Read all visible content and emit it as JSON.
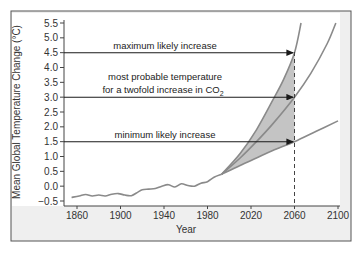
{
  "chart_data": {
    "type": "line",
    "title": "",
    "xlabel": "Year",
    "ylabel": "Mean Global Temperature Change (°C)",
    "xlim": [
      1850,
      2105
    ],
    "ylim": [
      -0.5,
      5.5
    ],
    "x_ticks": [
      "1860",
      "1900",
      "1940",
      "1980",
      "2020",
      "2060",
      "2100"
    ],
    "y_ticks": [
      "5.5",
      "5.0",
      "4.5",
      "4.0",
      "3.5",
      "3.0",
      "2.5",
      "2.0",
      "1.5",
      "1.0",
      "0.5",
      "0.0",
      "-0.5"
    ],
    "grid": false,
    "series": [
      {
        "name": "observed",
        "x": [
          1855,
          1862,
          1868,
          1874,
          1880,
          1886,
          1892,
          1898,
          1904,
          1910,
          1916,
          1920,
          1926,
          1932,
          1938,
          1944,
          1950,
          1956,
          1962,
          1968,
          1974,
          1980,
          1986,
          1993
        ],
        "values": [
          -0.38,
          -0.33,
          -0.28,
          -0.33,
          -0.3,
          -0.33,
          -0.27,
          -0.25,
          -0.3,
          -0.32,
          -0.2,
          -0.12,
          -0.1,
          -0.08,
          0.0,
          0.05,
          -0.03,
          0.08,
          0.02,
          0.0,
          0.1,
          0.15,
          0.3,
          0.4
        ]
      },
      {
        "name": "maximum likely increase",
        "x": [
          1993,
          2010,
          2025,
          2040,
          2050,
          2060,
          2066
        ],
        "values": [
          0.4,
          1.1,
          1.9,
          2.9,
          3.6,
          4.5,
          5.5
        ]
      },
      {
        "name": "most probable temperature for a twofold increase in CO2",
        "x": [
          1993,
          2010,
          2025,
          2040,
          2060,
          2075,
          2090,
          2098
        ],
        "values": [
          0.4,
          0.95,
          1.5,
          2.1,
          3.0,
          3.8,
          4.8,
          5.5
        ]
      },
      {
        "name": "minimum likely increase",
        "x": [
          1993,
          2010,
          2025,
          2040,
          2060,
          2080,
          2100
        ],
        "values": [
          0.4,
          0.7,
          0.95,
          1.2,
          1.5,
          1.85,
          2.2
        ]
      }
    ],
    "annotations": [
      {
        "text": "maximum likely increase",
        "value": 4.5,
        "arrow_to_year": 2060
      },
      {
        "text": "most probable temperature",
        "text2": "for a twofold increase in CO",
        "subscript": "2",
        "value": 3.0,
        "arrow_to_year": 2060
      },
      {
        "text": "minimum likely increase",
        "value": 1.5,
        "arrow_to_year": 2060
      }
    ],
    "reference_line": {
      "year": 2060,
      "style": "dashed"
    },
    "shaded_region": "between maximum and minimum likely increase from ~1993 to 2060"
  },
  "colors": {
    "curve": "#8a8a8a",
    "shade": "#c4c4c4",
    "arrow": "#1a1a1a",
    "frame": "#555555",
    "panel_bg": "#efefef"
  }
}
